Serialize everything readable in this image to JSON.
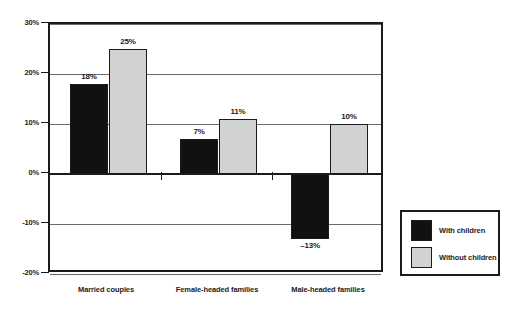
{
  "chart_data": {
    "type": "bar",
    "title": "",
    "xlabel": "",
    "ylabel": "",
    "ylim": [
      -20,
      30
    ],
    "ytick_values": [
      30,
      20,
      10,
      0,
      -10,
      -20
    ],
    "ytick_labels": [
      "30%",
      "20%",
      "10%",
      "0%",
      "-10%",
      "-20%"
    ],
    "grid": true,
    "legend_position": "right",
    "categories": [
      "Married couples",
      "Female-headed families",
      "Male-headed families"
    ],
    "series": [
      {
        "name": "With children",
        "color": "#111111",
        "values": [
          18,
          7,
          -13
        ],
        "labels": [
          "18%",
          "7%",
          "–13%"
        ]
      },
      {
        "name": "Without children",
        "color": "#d2d2d2",
        "values": [
          25,
          11,
          10
        ],
        "labels": [
          "25%",
          "11%",
          "10%"
        ]
      }
    ]
  },
  "legend": {
    "items": [
      {
        "label": "With children",
        "swatch": "dark-swatch"
      },
      {
        "label": "Without children",
        "swatch": "light-swatch"
      }
    ]
  }
}
